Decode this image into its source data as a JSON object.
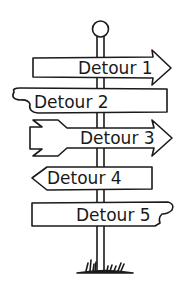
{
  "illustration": {
    "subject": "signpost",
    "colors": {
      "ink": "#1a1a1a",
      "background": "#ffffff"
    },
    "signs": [
      {
        "label": "Detour 1",
        "direction": "right"
      },
      {
        "label": "Detour 2",
        "direction": "none"
      },
      {
        "label": "Detour 3",
        "direction": "right"
      },
      {
        "label": "Detour 4",
        "direction": "left"
      },
      {
        "label": "Detour 5",
        "direction": "none"
      }
    ]
  }
}
